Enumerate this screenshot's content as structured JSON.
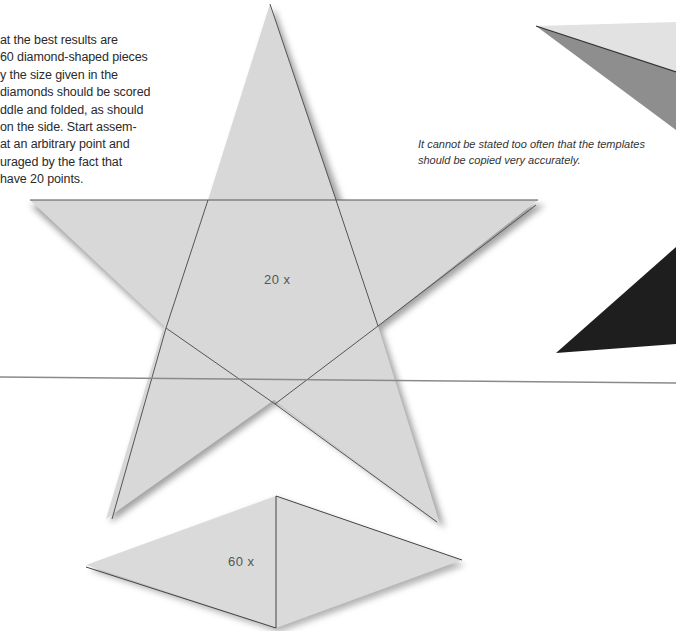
{
  "body_text": {
    "lines": [
      "at the best results are",
      "60 diamond-shaped pieces",
      "y the size given in the",
      "diamonds should be scored",
      "ddle and folded, as should",
      "on the side. Start assem-",
      "at an arbitrary point and",
      "uraged by the fact that",
      "have 20 points."
    ],
    "text": "at the best results are\n60 diamond-shaped pieces\ny the size given in the\ndiamonds should be scored\nddle and folded, as should\non the side. Start assem-\nat an arbitrary point and\nuraged by the fact that\nhave 20 points."
  },
  "caption": {
    "text": "It cannot be stated too often that the templates\nshould be copied very accurately."
  },
  "templates": {
    "star": {
      "label": "20 x",
      "fill": "#d9d9d9",
      "line": "#555555"
    },
    "diamond": {
      "label": "60 x",
      "fill": "#dadada",
      "line": "#444444"
    }
  },
  "model_preview": {
    "light_face": "#dedede",
    "mid_face": "#8c8c8c",
    "dark_face": "#1f1f1f"
  },
  "rule_line_color": "#8a8a8a"
}
